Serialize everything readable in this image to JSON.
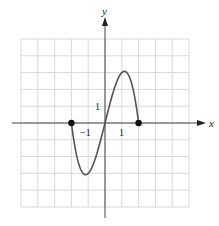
{
  "chart_data": {
    "type": "line",
    "title": "",
    "xlabel": "x",
    "ylabel": "y",
    "xlim": [
      -5,
      5
    ],
    "ylim": [
      -5,
      5
    ],
    "grid": true,
    "tick_labels": {
      "x": [
        "-1",
        "1"
      ],
      "y": [
        "1"
      ]
    },
    "series": [
      {
        "name": "f(x) = 4x - x^3",
        "domain": [
          -2,
          2
        ],
        "x": [
          -2,
          -1.5,
          -1.15,
          -1,
          -0.5,
          0,
          0.5,
          1,
          1.15,
          1.5,
          2
        ],
        "y": [
          0,
          -2.625,
          -3.08,
          -3,
          -1.875,
          0,
          1.875,
          3,
          3.08,
          2.625,
          0
        ]
      }
    ],
    "endpoints": [
      [
        -2,
        0
      ],
      [
        2,
        0
      ]
    ],
    "colors": {
      "curve": "#555555",
      "axes": "#444444",
      "grid": "#d9d9d9",
      "points": "#111111"
    }
  },
  "labels": {
    "x_axis": "x",
    "y_axis": "y",
    "x_tick_neg1": "−1",
    "x_tick_1": "1",
    "y_tick_1": "1"
  }
}
